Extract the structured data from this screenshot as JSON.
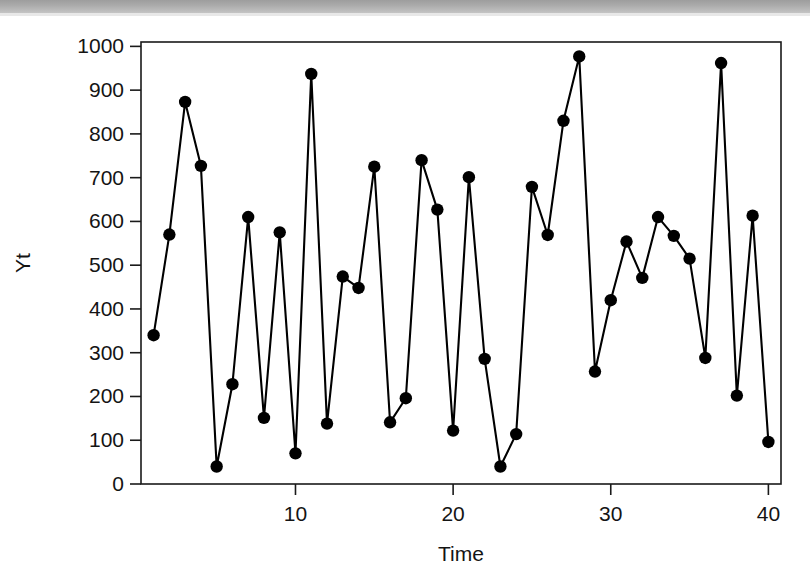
{
  "figure": {
    "kind": "time-series-line-plot",
    "background_color": "#ffffff",
    "ink_color": "#000000",
    "scan_banner_color": "#a8a8a8"
  },
  "chart_data": {
    "type": "line",
    "title": "",
    "xlabel": "Time",
    "ylabel": "Yt",
    "xlim": [
      0.2,
      40.8
    ],
    "ylim": [
      0,
      1010
    ],
    "grid": false,
    "legend": false,
    "marker": "filled-circle",
    "x": [
      1,
      2,
      3,
      4,
      5,
      6,
      7,
      8,
      9,
      10,
      11,
      12,
      13,
      14,
      15,
      16,
      17,
      18,
      19,
      20,
      21,
      22,
      23,
      24,
      25,
      26,
      27,
      28,
      29,
      30,
      31,
      32,
      33,
      34,
      35,
      36,
      37,
      38,
      39,
      40
    ],
    "values": [
      340,
      570,
      873,
      727,
      40,
      228,
      610,
      151,
      575,
      70,
      937,
      138,
      474,
      448,
      725,
      141,
      196,
      740,
      627,
      122,
      701,
      286,
      40,
      114,
      679,
      569,
      830,
      977,
      257,
      420,
      554,
      471,
      610,
      567,
      515,
      288,
      962,
      202,
      613,
      96
    ],
    "xticks": [
      10,
      20,
      30,
      40
    ],
    "xtick_labels": [
      "10",
      "20",
      "30",
      "40"
    ],
    "yticks": [
      0,
      100,
      200,
      300,
      400,
      500,
      600,
      700,
      800,
      900,
      1000
    ],
    "ytick_labels": [
      "0",
      "100",
      "200",
      "300",
      "400",
      "500",
      "600",
      "700",
      "800",
      "900",
      "1000"
    ]
  }
}
